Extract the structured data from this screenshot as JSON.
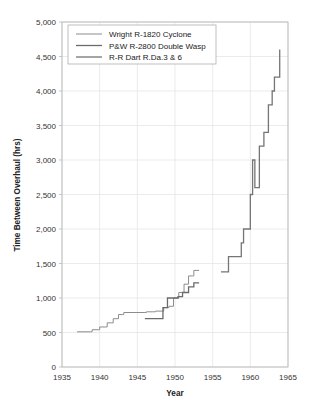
{
  "chart_data": {
    "type": "line",
    "title": "",
    "xlabel": "Year",
    "ylabel": "Time Between Overhaul (hrs)",
    "xlim": [
      1935,
      1965
    ],
    "ylim": [
      0,
      5000
    ],
    "xticks": [
      "1935",
      "1940",
      "1945",
      "1950",
      "1955",
      "1960",
      "1965"
    ],
    "yticks": [
      "0",
      "500",
      "1,000",
      "1,500",
      "2,000",
      "2,500",
      "3,000",
      "3,500",
      "4,000",
      "4,500",
      "5,000"
    ],
    "grid": true,
    "legend_position": "top-left",
    "step_style": "post",
    "series": [
      {
        "name": "Wright R-1820 Cyclone",
        "color": "#8c8c8c",
        "width": 1.0,
        "points": [
          [
            1937.0,
            510
          ],
          [
            1938.8,
            510
          ],
          [
            1939.0,
            540
          ],
          [
            1939.8,
            540
          ],
          [
            1940.0,
            580
          ],
          [
            1940.8,
            580
          ],
          [
            1941.0,
            640
          ],
          [
            1941.6,
            640
          ],
          [
            1941.8,
            700
          ],
          [
            1942.3,
            700
          ],
          [
            1942.5,
            760
          ],
          [
            1943.0,
            760
          ],
          [
            1943.2,
            790
          ],
          [
            1946.0,
            790
          ],
          [
            1946.2,
            800
          ],
          [
            1947.2,
            800
          ],
          [
            1947.4,
            810
          ],
          [
            1948.3,
            810
          ],
          [
            1948.5,
            860
          ],
          [
            1949.0,
            860
          ],
          [
            1949.2,
            880
          ],
          [
            1949.6,
            880
          ],
          [
            1949.8,
            1000
          ],
          [
            1950.3,
            1000
          ],
          [
            1950.5,
            1080
          ],
          [
            1951.0,
            1080
          ],
          [
            1951.2,
            1200
          ],
          [
            1951.6,
            1200
          ],
          [
            1951.8,
            1320
          ],
          [
            1952.3,
            1320
          ],
          [
            1952.5,
            1400
          ],
          [
            1953.2,
            1400
          ]
        ]
      },
      {
        "name": "P&W R-2800 Double Wasp",
        "color": "#6b6b6b",
        "width": 1.3,
        "points": [
          [
            1946.0,
            700
          ],
          [
            1948.2,
            700
          ],
          [
            1948.4,
            860
          ],
          [
            1948.8,
            860
          ],
          [
            1949.0,
            1000
          ],
          [
            1950.2,
            1000
          ],
          [
            1950.4,
            1020
          ],
          [
            1950.8,
            1020
          ],
          [
            1951.0,
            1080
          ],
          [
            1951.6,
            1080
          ],
          [
            1951.8,
            1160
          ],
          [
            1952.3,
            1160
          ],
          [
            1952.5,
            1220
          ],
          [
            1953.2,
            1220
          ]
        ]
      },
      {
        "name": "R-R Dart R.Da.3 & 6",
        "color": "#757575",
        "width": 1.3,
        "points": [
          [
            1956.1,
            1380
          ],
          [
            1956.9,
            1380
          ],
          [
            1957.1,
            1600
          ],
          [
            1958.6,
            1600
          ],
          [
            1958.8,
            1800
          ],
          [
            1959.0,
            1800
          ],
          [
            1959.1,
            2000
          ],
          [
            1959.8,
            2000
          ],
          [
            1960.0,
            2500
          ],
          [
            1960.2,
            2500
          ],
          [
            1960.3,
            3000
          ],
          [
            1960.5,
            3000
          ],
          [
            1960.6,
            2600
          ],
          [
            1961.0,
            2600
          ],
          [
            1961.2,
            3200
          ],
          [
            1961.6,
            3200
          ],
          [
            1961.8,
            3400
          ],
          [
            1962.2,
            3400
          ],
          [
            1962.4,
            3800
          ],
          [
            1962.7,
            3800
          ],
          [
            1962.9,
            4000
          ],
          [
            1963.1,
            4000
          ],
          [
            1963.2,
            4200
          ],
          [
            1963.7,
            4200
          ],
          [
            1963.9,
            4600
          ]
        ]
      }
    ]
  },
  "legend": {
    "items": [
      {
        "label": "Wright R-1820 Cyclone"
      },
      {
        "label": "P&W R-2800 Double Wasp"
      },
      {
        "label": "R-R Dart R.Da.3 & 6"
      }
    ]
  },
  "axes": {
    "x_title": "Year",
    "y_title": "Time Between Overhaul (hrs)"
  },
  "colors": {
    "background": "#ffffff",
    "grid": "#e2e2e2",
    "frame": "#b9b9b9",
    "text": "#333333",
    "series_light": "#8c8c8c",
    "series_mid": "#6b6b6b",
    "series_dark": "#757575"
  }
}
